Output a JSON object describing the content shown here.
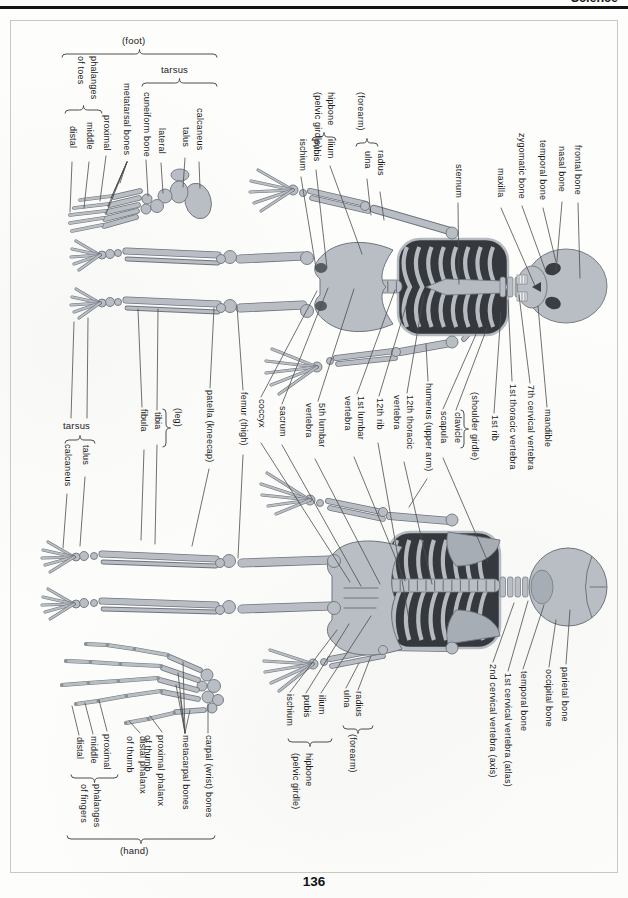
{
  "page": {
    "header": "Science",
    "page_number": "136"
  },
  "foot_diagram": {
    "title": "(foot)",
    "tarsus": "tarsus",
    "labels": {
      "phalanges_of_toes": "phalanges\nof toes",
      "distal": "distal",
      "middle": "middle",
      "proximal": "proximal",
      "metatarsal_bones": "metatarsal bones",
      "cuneiform_bone": "cuneiform bone",
      "lateral": "lateral",
      "talus": "talus",
      "calcaneus": "calcaneus"
    }
  },
  "front_skeleton": {
    "upper_labels": {
      "sternum": "sternum",
      "maxilla": "maxilla",
      "zygomatic_bone": "zygomatic bone",
      "temporal_bone": "temporal bone",
      "nasal_bone": "nasal bone",
      "frontal_bone": "frontal bone"
    },
    "pelvic_girdle": {
      "title": "hipbone\n(pelvic girdle)",
      "ischium": "ischium",
      "pubis": "pubis",
      "ilium": "ilium"
    },
    "forearm": {
      "title": "(forearm)",
      "ulna": "ulna",
      "radius": "radius"
    },
    "lower_labels": {
      "mandible": "mandible",
      "cervical_7": "7th cervical vertebra",
      "thoracic_1": "1st thoracic vertebra",
      "rib_1": "1st rib"
    },
    "shoulder_girdle": {
      "title": "(shoulder girdle)",
      "clavicle": "clavicle",
      "scapula": "scapula"
    }
  },
  "mid_labels": {
    "tarsus": {
      "title": "tarsus",
      "talus": "talus",
      "calcaneus": "calcaneus"
    },
    "leg": {
      "title": "(leg)",
      "tibia": "tibia",
      "fibula": "fibula"
    },
    "patella": "patella (kneecap)",
    "femur": "femur (thigh)",
    "coccyx": "coccyx",
    "sacrum": "sacrum",
    "lumbar_5": "5th lumbar\nvertebra",
    "lumbar_1": "1st lumbar\nvertebra",
    "rib_12": "12th rib",
    "thoracic_12": "12th thoracic\nvertebra",
    "humerus": "humerus (upper arm)"
  },
  "back_skeleton": {
    "skull_labels": {
      "parietal_bone": "parietal bone",
      "occipital_bone": "occipital bone",
      "temporal_bone": "temporal bone",
      "atlas": "1st cervical vertebra (atlas)",
      "axis": "2nd cervical vertebra (axis)"
    },
    "pelvic_girdle": {
      "title": "hipbone\n(pelvic girdle)",
      "ischium": "ischium",
      "pubis": "pubis",
      "ilium": "ilium"
    },
    "forearm": {
      "title": "(forearm)",
      "ulna": "ulna",
      "radius": "radius"
    }
  },
  "hand_diagram": {
    "title": "(hand)",
    "labels": {
      "distal": "distal",
      "middle": "middle",
      "proximal": "proximal",
      "phalanges_of_fingers": "phalanges\nof fingers",
      "distal_phalanx_thumb": "distal phalanx\nof thumb",
      "proximal_phalanx_thumb": "proximal phalanx\nof thumb",
      "metacarpal_bones": "metacarpal bones",
      "carpal_bones": "carpal (wrist) bones"
    }
  },
  "colors": {
    "bone": "#b9bec4",
    "bone_dark": "#6e747b",
    "rib_gap": "#35393d",
    "leader_line": "#4d4d4d",
    "text": "#1b1b1b"
  }
}
